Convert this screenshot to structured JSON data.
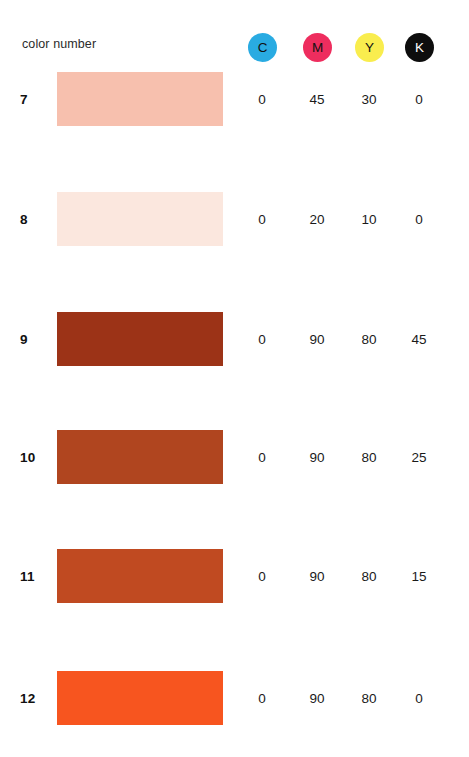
{
  "header": {
    "label": "color number",
    "inks": [
      {
        "name": "cyan",
        "letter": "C",
        "fill": "#29ABE2",
        "text": "#111111",
        "x": 248
      },
      {
        "name": "magenta",
        "letter": "M",
        "fill": "#EE2D5E",
        "text": "#111111",
        "x": 303
      },
      {
        "name": "yellow",
        "letter": "Y",
        "fill": "#F9ED4E",
        "text": "#111111",
        "x": 355
      },
      {
        "name": "black",
        "letter": "K",
        "fill": "#0D0D0D",
        "text": "#ffffff",
        "x": 405
      }
    ]
  },
  "columns": [
    {
      "key": "c",
      "x": 242
    },
    {
      "key": "m",
      "x": 297
    },
    {
      "key": "y",
      "x": 349
    },
    {
      "key": "k",
      "x": 399
    }
  ],
  "rows": [
    {
      "number": "7",
      "swatch_color": "#F7C0AE",
      "y": 72,
      "values": [
        "0",
        "45",
        "30",
        "0"
      ]
    },
    {
      "number": "8",
      "swatch_color": "#FBE7DE",
      "y": 192,
      "values": [
        "0",
        "20",
        "10",
        "0"
      ]
    },
    {
      "number": "9",
      "swatch_color": "#9C3317",
      "y": 312,
      "values": [
        "0",
        "90",
        "80",
        "45"
      ]
    },
    {
      "number": "10",
      "swatch_color": "#B0451F",
      "y": 430,
      "values": [
        "0",
        "90",
        "80",
        "25"
      ]
    },
    {
      "number": "11",
      "swatch_color": "#C04A21",
      "y": 549,
      "values": [
        "0",
        "90",
        "80",
        "15"
      ]
    },
    {
      "number": "12",
      "swatch_color": "#F7551F",
      "y": 671,
      "values": [
        "0",
        "90",
        "80",
        "0"
      ]
    }
  ],
  "chart_data": {
    "type": "table",
    "title": "",
    "xlabel": "",
    "ylabel": "",
    "row_header": "color number",
    "categories": [
      "7",
      "8",
      "9",
      "10",
      "11",
      "12"
    ],
    "columns": [
      "C",
      "M",
      "Y",
      "K"
    ],
    "series": [
      {
        "name": "C",
        "values": [
          0,
          0,
          0,
          0,
          0,
          0
        ]
      },
      {
        "name": "M",
        "values": [
          45,
          20,
          90,
          90,
          90,
          90
        ]
      },
      {
        "name": "Y",
        "values": [
          30,
          10,
          80,
          80,
          80,
          80
        ]
      },
      {
        "name": "K",
        "values": [
          0,
          0,
          45,
          25,
          15,
          0
        ]
      }
    ],
    "swatch_colors": [
      "#F7C0AE",
      "#FBE7DE",
      "#9C3317",
      "#B0451F",
      "#C04A21",
      "#F7551F"
    ]
  }
}
